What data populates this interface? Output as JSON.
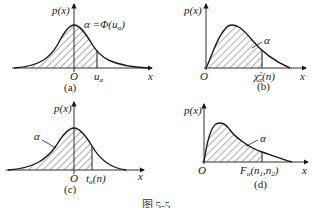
{
  "figure": {
    "caption": "图 5-5",
    "panels": [
      {
        "id": "a",
        "label": "(a)",
        "y_axis": "p(x)",
        "x_axis": "x",
        "origin": "O",
        "quantile": "u_α",
        "annotation": "α = Φ(u_α)",
        "distribution": "standard normal",
        "shaded": "left tail up to u_α"
      },
      {
        "id": "b",
        "label": "(b)",
        "y_axis": "p(x)",
        "x_axis": "x",
        "origin": "O",
        "quantile": "χ²_α(n)",
        "annotation": "α",
        "distribution": "chi-square",
        "shaded": "left region up to χ²_α(n)"
      },
      {
        "id": "c",
        "label": "(c)",
        "y_axis": "p(x)",
        "x_axis": "x",
        "origin": "O",
        "quantile": "t_α(n)",
        "annotation": "α",
        "distribution": "Student t",
        "shaded": "left tail up to t_α(n)"
      },
      {
        "id": "d",
        "label": "(d)",
        "y_axis": "p(x)",
        "x_axis": "x",
        "origin": "O",
        "quantile": "F_α(n1,n2)",
        "annotation": "α",
        "distribution": "F",
        "shaded": "left region up to F_α(n1,n2)"
      }
    ]
  },
  "labels": {
    "px": "p(x)",
    "x": "x",
    "O": "O",
    "alpha": "α",
    "a_eq": "α =Φ(u",
    "a_eq_sub": "α",
    "a_eq_close": ")",
    "u": "u",
    "u_sub": "α",
    "chi": "χ",
    "chi_sup": "2",
    "chi_sub": "α",
    "chi_arg": "(n)",
    "t": "t",
    "t_sub": "α",
    "t_arg": "(n)",
    "F": "F",
    "F_sub": "α",
    "F_arg": "(n",
    "F_n1": "1",
    "F_comma": ",n",
    "F_n2": "2",
    "F_close": ")",
    "pa": "(a)",
    "pb": "(b)",
    "pc": "(c)",
    "pd": "(d)"
  }
}
